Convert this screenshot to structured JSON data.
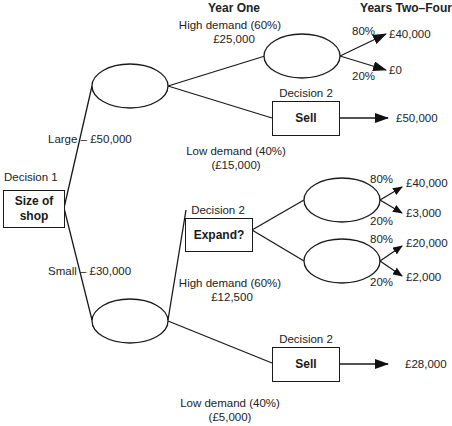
{
  "headers": {
    "year_one": "Year One",
    "years_two_four": "Years Two–Four"
  },
  "decision1": {
    "label": "Decision 1",
    "box_line1": "Size of",
    "box_line2": "shop"
  },
  "branches": {
    "large": "Large – £50,000",
    "small": "Small – £30,000"
  },
  "large": {
    "high_demand": {
      "label": "High demand (60%)",
      "value": "£25,000"
    },
    "low_demand": {
      "label": "Low demand (40%)",
      "value": "(£15,000)"
    },
    "high_outcomes": [
      {
        "prob": "80%",
        "value": "£40,000"
      },
      {
        "prob": "20%",
        "value": "£0"
      }
    ],
    "sell_decision": {
      "label": "Decision 2",
      "box": "Sell",
      "value": "£50,000"
    }
  },
  "small": {
    "high_demand": {
      "label": "High demand (60%)",
      "value": "£12,500"
    },
    "low_demand": {
      "label": "Low demand (40%)",
      "value": "(£5,000)"
    },
    "expand_decision": {
      "label": "Decision 2",
      "box": "Expand?"
    },
    "expand_upper_outcomes": [
      {
        "prob": "80%",
        "value": "£40,000"
      },
      {
        "prob": "20%",
        "value": "£3,000"
      }
    ],
    "expand_lower_outcomes": [
      {
        "prob": "80%",
        "value": "£20,000"
      },
      {
        "prob": "20%",
        "value": "£2,000"
      }
    ],
    "sell_decision": {
      "label": "Decision 2",
      "box": "Sell",
      "value": "£28,000"
    }
  }
}
